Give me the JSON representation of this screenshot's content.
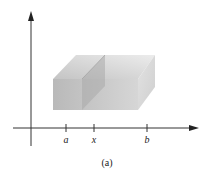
{
  "figure": {
    "caption": "(a)",
    "axes": {
      "x_axis": "horizontal axis with arrow",
      "y_axis": "vertical axis with arrow"
    },
    "ticks": [
      {
        "label": "a"
      },
      {
        "label": "x"
      },
      {
        "label": "b"
      }
    ],
    "solid": {
      "shape": "rectangular box over interval [a, b]",
      "cross_section": "vertical plane at x"
    },
    "colors": {
      "axis": "#333333",
      "front_face": "#bdbdbd",
      "top_face": "#dcdcdc",
      "side_face": "#d2d2d2",
      "plane": "#a8a8a8"
    }
  }
}
